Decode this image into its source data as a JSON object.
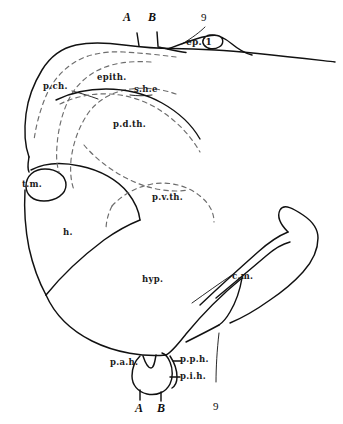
{
  "figure": {
    "type": "anatomical-line-drawing",
    "background_color": "#ffffff",
    "ink_color": "#111111",
    "dash_color": "#6b6b6b",
    "width": 343,
    "height": 424
  },
  "labels": {
    "top_a": "A",
    "top_b": "B",
    "top_nine": "9",
    "ep": "ep. 1",
    "p_ch": "p.ch.",
    "epith": "epith.",
    "s_h_e": "s.h.e",
    "p_d_th": "p.d.th.",
    "t_m": "t.m.",
    "p_v_th": "p.v.th.",
    "h": "h.",
    "hyp": "hyp.",
    "c_m": "c.m.",
    "p_a_h": "p.a.h.",
    "p_p_h": "p.p.h.",
    "p_i_h": "p.i.h.",
    "bottom_a": "A",
    "bottom_b": "B",
    "bottom_nine": "9"
  }
}
